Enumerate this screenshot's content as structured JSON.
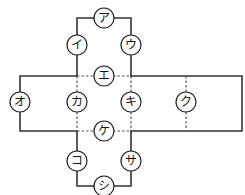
{
  "diagram": {
    "title": "",
    "colors": {
      "line": "#333333",
      "fold": "#555555",
      "circle_stroke": "#222222",
      "background": "#ffffff"
    },
    "labels": {
      "a": "ア",
      "i": "イ",
      "u": "ウ",
      "e": "エ",
      "o": "オ",
      "ka": "カ",
      "ki": "キ",
      "ku": "ク",
      "ke": "ケ",
      "ko": "コ",
      "sa": "サ",
      "shi": "シ"
    },
    "nodes": [
      {
        "key": "a",
        "label": "ア",
        "x": 104,
        "y": 18
      },
      {
        "key": "i",
        "label": "イ",
        "x": 77,
        "y": 45
      },
      {
        "key": "u",
        "label": "ウ",
        "x": 131,
        "y": 45
      },
      {
        "key": "e",
        "label": "エ",
        "x": 104,
        "y": 76
      },
      {
        "key": "o",
        "label": "オ",
        "x": 20,
        "y": 102
      },
      {
        "key": "ka",
        "label": "カ",
        "x": 77,
        "y": 102
      },
      {
        "key": "ki",
        "label": "キ",
        "x": 131,
        "y": 102
      },
      {
        "key": "ku",
        "label": "ク",
        "x": 186,
        "y": 102
      },
      {
        "key": "ke",
        "label": "ケ",
        "x": 104,
        "y": 131
      },
      {
        "key": "ko",
        "label": "コ",
        "x": 77,
        "y": 161
      },
      {
        "key": "sa",
        "label": "サ",
        "x": 131,
        "y": 161
      },
      {
        "key": "shi",
        "label": "シ",
        "x": 104,
        "y": 186
      }
    ]
  }
}
